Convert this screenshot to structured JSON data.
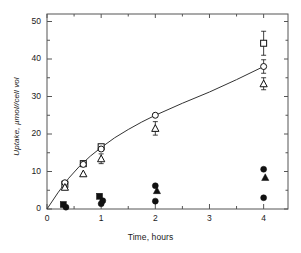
{
  "chart_data": {
    "type": "scatter",
    "title": "",
    "subtitle": "",
    "xlabel": "Time, hours",
    "ylabel": "Uptake, µmol//cell vol",
    "xlim": [
      0,
      4.45
    ],
    "ylim": [
      0,
      52
    ],
    "x_ticks": [
      0,
      1,
      2,
      3,
      4
    ],
    "x_tick_labels": [
      "0",
      "1",
      "2",
      "3",
      "4"
    ],
    "x_minor_ticks": [
      0.5,
      1.5,
      2.5,
      3.5
    ],
    "y_ticks": [
      0,
      10,
      20,
      30,
      40,
      50
    ],
    "y_tick_labels": [
      "0",
      "10",
      "20",
      "30",
      "40",
      "50"
    ],
    "y_minor_ticks": [
      5,
      15,
      25,
      35,
      45
    ],
    "grid": false,
    "frame": true,
    "legend": false,
    "legend_position": "none",
    "axis_color": "#555555",
    "marker_color": "#111111",
    "curve_color": "#333333",
    "series": [
      {
        "name": "open-square",
        "marker": "open-square",
        "points": [
          {
            "x": 0.33,
            "y": 6.6,
            "yerr": 0
          },
          {
            "x": 0.67,
            "y": 12.1,
            "yerr": 0
          },
          {
            "x": 1.0,
            "y": 16.6,
            "yerr": 0
          },
          {
            "x": 4.0,
            "y": 44.2,
            "yerr": 3.2
          }
        ]
      },
      {
        "name": "open-circle",
        "marker": "open-circle",
        "points": [
          {
            "x": 0.33,
            "y": 7.0,
            "yerr": 0
          },
          {
            "x": 0.67,
            "y": 11.9,
            "yerr": 0
          },
          {
            "x": 1.0,
            "y": 16.0,
            "yerr": 0
          },
          {
            "x": 2.0,
            "y": 25.0,
            "yerr": 0
          },
          {
            "x": 4.0,
            "y": 38.0,
            "yerr": 1.8
          }
        ]
      },
      {
        "name": "open-triangle",
        "marker": "open-triangle",
        "points": [
          {
            "x": 0.33,
            "y": 5.8,
            "yerr": 0
          },
          {
            "x": 0.67,
            "y": 9.4,
            "yerr": 0
          },
          {
            "x": 1.0,
            "y": 13.4,
            "yerr": 1.3
          },
          {
            "x": 2.0,
            "y": 21.5,
            "yerr": 1.8
          },
          {
            "x": 4.0,
            "y": 33.4,
            "yerr": 1.6
          }
        ]
      },
      {
        "name": "filled-square",
        "marker": "filled-square",
        "points": [
          {
            "x": 0.3,
            "y": 1.2,
            "yerr": 0
          },
          {
            "x": 0.97,
            "y": 3.4,
            "yerr": 0
          }
        ]
      },
      {
        "name": "filled-triangle",
        "marker": "filled-triangle",
        "points": [
          {
            "x": 2.03,
            "y": 4.9,
            "yerr": 0
          },
          {
            "x": 4.03,
            "y": 8.4,
            "yerr": 0
          }
        ]
      },
      {
        "name": "filled-circle-upper",
        "marker": "filled-circle",
        "points": [
          {
            "x": 0.35,
            "y": 0.5,
            "yerr": 0
          },
          {
            "x": 1.03,
            "y": 2.2,
            "yerr": 0
          },
          {
            "x": 2.0,
            "y": 6.2,
            "yerr": 0
          },
          {
            "x": 4.0,
            "y": 10.6,
            "yerr": 0
          }
        ]
      },
      {
        "name": "filled-circle-lower",
        "marker": "filled-circle",
        "points": [
          {
            "x": 1.0,
            "y": 1.4,
            "yerr": 0
          },
          {
            "x": 2.0,
            "y": 2.1,
            "yerr": 0
          },
          {
            "x": 4.0,
            "y": 3.0,
            "yerr": 0
          }
        ]
      }
    ],
    "fit_curve": {
      "name": "saturating-fit",
      "description": "smooth saturating curve through open circles",
      "points": [
        {
          "x": 0.0,
          "y": 0.0
        },
        {
          "x": 0.2,
          "y": 4.3
        },
        {
          "x": 0.4,
          "y": 8.2
        },
        {
          "x": 0.6,
          "y": 11.4
        },
        {
          "x": 0.8,
          "y": 14.1
        },
        {
          "x": 1.0,
          "y": 16.4
        },
        {
          "x": 1.25,
          "y": 19.0
        },
        {
          "x": 1.5,
          "y": 21.2
        },
        {
          "x": 1.75,
          "y": 23.2
        },
        {
          "x": 2.0,
          "y": 25.0
        },
        {
          "x": 2.5,
          "y": 28.2
        },
        {
          "x": 3.0,
          "y": 31.2
        },
        {
          "x": 3.5,
          "y": 34.5
        },
        {
          "x": 4.0,
          "y": 38.0
        }
      ]
    }
  }
}
